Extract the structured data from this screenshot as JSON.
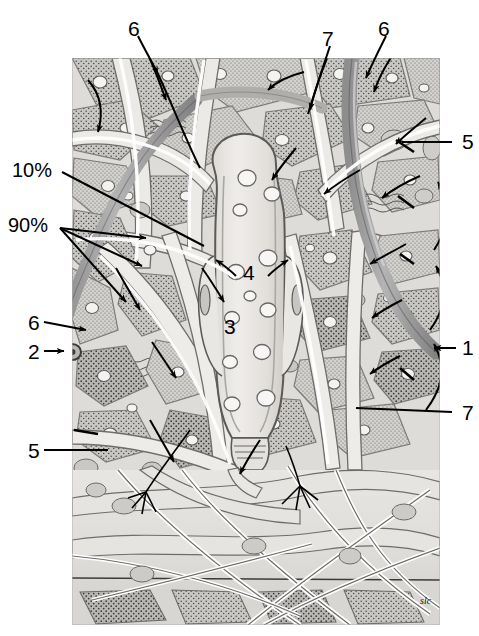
{
  "figure": {
    "type": "histological-illustration",
    "signature": "slc",
    "background_color": "#ffffff",
    "tissue_fill": "#cfcfcf",
    "tissue_light": "#e6e4e0",
    "vessel_color": "#9a9a9a",
    "ink_color": "#000000",
    "canal_fill": "#ebe9e6"
  },
  "labels": [
    {
      "id": "label-6-top-left",
      "text": "6",
      "x": 128,
      "y": 18,
      "kind": "number"
    },
    {
      "id": "label-7-top",
      "text": "7",
      "x": 322,
      "y": 28,
      "kind": "number"
    },
    {
      "id": "label-6-top-right",
      "text": "6",
      "x": 378,
      "y": 18,
      "kind": "number"
    },
    {
      "id": "label-10-percent",
      "text": "10%",
      "x": 12,
      "y": 160,
      "kind": "percent"
    },
    {
      "id": "label-90-percent",
      "text": "90%",
      "x": 8,
      "y": 215,
      "kind": "percent"
    },
    {
      "id": "label-5-right",
      "text": "5",
      "x": 462,
      "y": 131,
      "kind": "number"
    },
    {
      "id": "label-4-center",
      "text": "4",
      "x": 243,
      "y": 262,
      "kind": "number"
    },
    {
      "id": "label-3-center",
      "text": "3",
      "x": 224,
      "y": 316,
      "kind": "number"
    },
    {
      "id": "label-6-left",
      "text": "6",
      "x": 28,
      "y": 312,
      "kind": "number"
    },
    {
      "id": "label-2-left",
      "text": "2",
      "x": 28,
      "y": 341,
      "kind": "number"
    },
    {
      "id": "label-1-right",
      "text": "1",
      "x": 462,
      "y": 337,
      "kind": "number"
    },
    {
      "id": "label-7-right",
      "text": "7",
      "x": 462,
      "y": 402,
      "kind": "number"
    },
    {
      "id": "label-5-bottom-left",
      "text": "5",
      "x": 28,
      "y": 440,
      "kind": "number"
    }
  ]
}
